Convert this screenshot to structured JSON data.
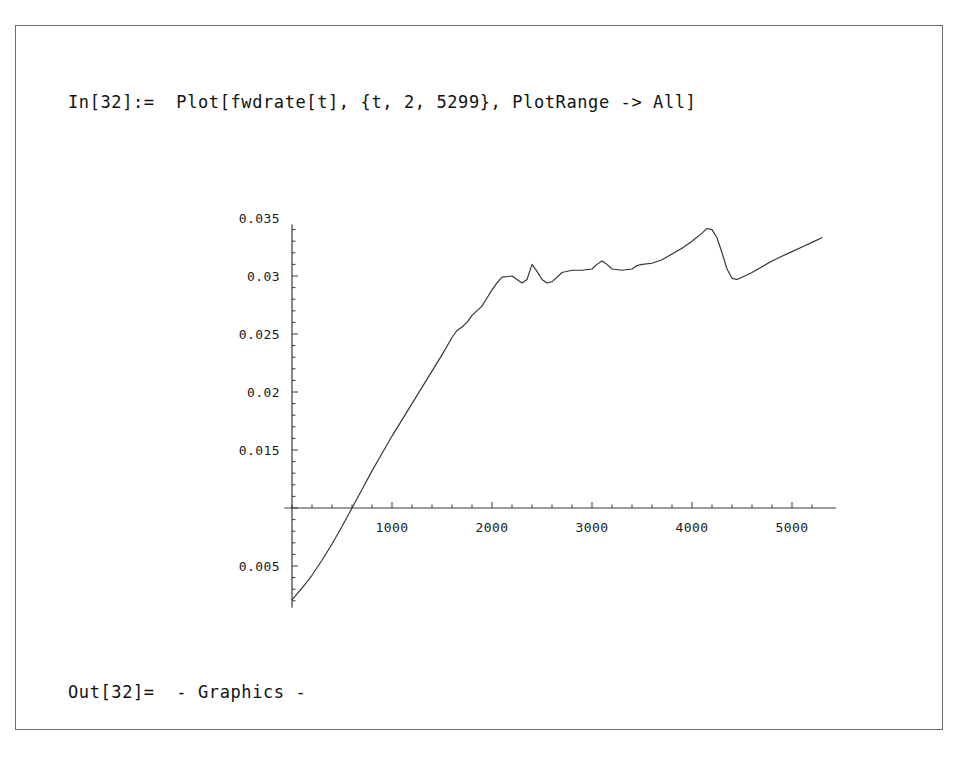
{
  "window": {
    "app": "Mathematica Notebook",
    "background_color": "#ffffff",
    "frame_color": "#6b6b6b"
  },
  "cells": {
    "input": {
      "prompt": "In[32]:=",
      "expression": "Plot[fwdrate[t], {t, 2, 5299}, PlotRange -> All]",
      "full_text": "In[32]:=  Plot[fwdrate[t], {t, 2, 5299}, PlotRange -> All]"
    },
    "output": {
      "prompt": "Out[32]=",
      "value": "- Graphics -",
      "full_text": "Out[32]=  - Graphics -"
    }
  },
  "chart_data": {
    "type": "line",
    "title": "",
    "xlabel": "",
    "ylabel": "",
    "line_color": "#333333",
    "axis_color": "#3a3a3a",
    "grid": false,
    "legend": false,
    "xlim": [
      2,
      5299
    ],
    "ylim": [
      0.0021,
      0.0341
    ],
    "x_ticks": [
      1000,
      2000,
      3000,
      4000,
      5000
    ],
    "x_tick_labels": [
      "1000",
      "2000",
      "3000",
      "4000",
      "5000"
    ],
    "y_ticks": [
      0.005,
      0.015,
      0.02,
      0.025,
      0.03,
      0.035
    ],
    "y_tick_labels": [
      "0.005",
      "0.015",
      "0.02",
      "0.025",
      "0.03",
      "0.035"
    ],
    "y_axis_crossing": 0.01,
    "x_minor_tick_step": 200,
    "y_minor_tick_step": 0.001,
    "x": [
      2,
      100,
      200,
      300,
      400,
      500,
      600,
      700,
      800,
      900,
      1000,
      1100,
      1200,
      1300,
      1400,
      1500,
      1600,
      1650,
      1700,
      1750,
      1800,
      1900,
      1950,
      2000,
      2050,
      2100,
      2200,
      2250,
      2300,
      2350,
      2400,
      2450,
      2500,
      2550,
      2600,
      2700,
      2800,
      2900,
      3000,
      3050,
      3100,
      3150,
      3200,
      3300,
      3400,
      3450,
      3500,
      3600,
      3700,
      3800,
      3900,
      4000,
      4100,
      4150,
      4200,
      4250,
      4300,
      4350,
      4400,
      4450,
      4500,
      4600,
      4700,
      4800,
      4900,
      5000,
      5100,
      5200,
      5299
    ],
    "y": [
      0.0021,
      0.0031,
      0.0042,
      0.0055,
      0.0069,
      0.0084,
      0.01,
      0.0116,
      0.0132,
      0.0147,
      0.0162,
      0.0176,
      0.019,
      0.0204,
      0.0218,
      0.0232,
      0.0247,
      0.0253,
      0.0256,
      0.026,
      0.0266,
      0.0274,
      0.0281,
      0.0288,
      0.0294,
      0.0299,
      0.03,
      0.0297,
      0.0294,
      0.0297,
      0.031,
      0.0304,
      0.0297,
      0.0294,
      0.0295,
      0.0303,
      0.0305,
      0.0305,
      0.0306,
      0.031,
      0.0313,
      0.031,
      0.0306,
      0.0305,
      0.0306,
      0.0309,
      0.031,
      0.0311,
      0.0314,
      0.0319,
      0.0324,
      0.033,
      0.0337,
      0.0341,
      0.034,
      0.0333,
      0.032,
      0.0306,
      0.0298,
      0.0297,
      0.0299,
      0.0303,
      0.0308,
      0.0313,
      0.0317,
      0.0321,
      0.0325,
      0.0329,
      0.0333
    ]
  }
}
